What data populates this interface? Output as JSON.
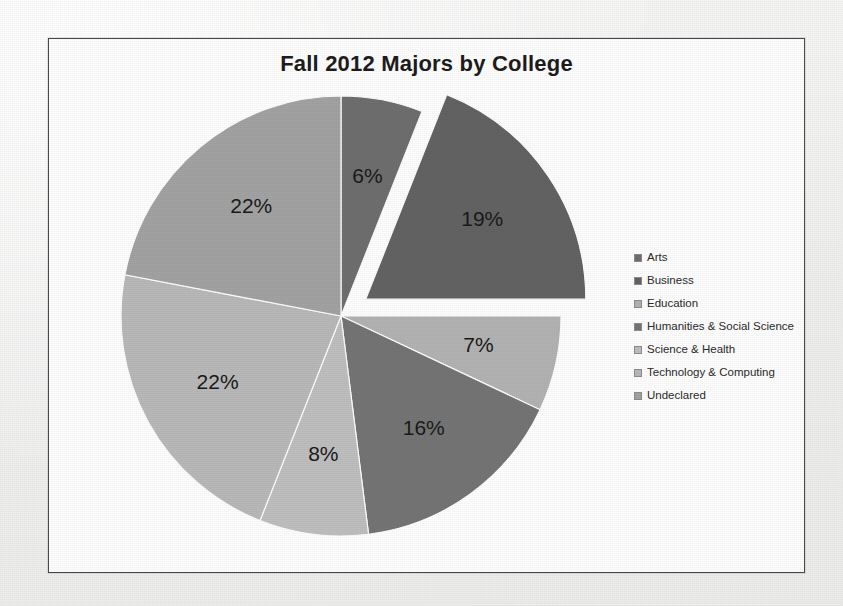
{
  "chart_data": {
    "type": "pie",
    "title": "Fall 2012 Majors by College",
    "categories": [
      "Arts",
      "Business",
      "Education",
      "Humanities & Social Science",
      "Science & Health",
      "Technology & Computing",
      "Undeclared"
    ],
    "values": [
      6,
      19,
      7,
      16,
      8,
      22,
      22
    ],
    "data_labels": [
      "6%",
      "19%",
      "7%",
      "16%",
      "8%",
      "22%",
      "22%"
    ],
    "colors": [
      "#6f6f6f",
      "#636363",
      "#b3b3b3",
      "#757575",
      "#bfbfbf",
      "#b9b9b9",
      "#a3a3a3"
    ],
    "exploded_slice": "Business",
    "start_angle_deg": 0,
    "direction": "clockwise",
    "legend_position": "right",
    "grid": false,
    "xlabel": "",
    "ylabel": ""
  },
  "legend": {
    "items": [
      {
        "label": "Arts",
        "color": "#6f6f6f"
      },
      {
        "label": "Business",
        "color": "#636363"
      },
      {
        "label": "Education",
        "color": "#b3b3b3"
      },
      {
        "label": "Humanities & Social Science",
        "color": "#757575"
      },
      {
        "label": "Science & Health",
        "color": "#bfbfbf"
      },
      {
        "label": "Technology & Computing",
        "color": "#b9b9b9"
      },
      {
        "label": "Undeclared",
        "color": "#a3a3a3"
      }
    ]
  }
}
